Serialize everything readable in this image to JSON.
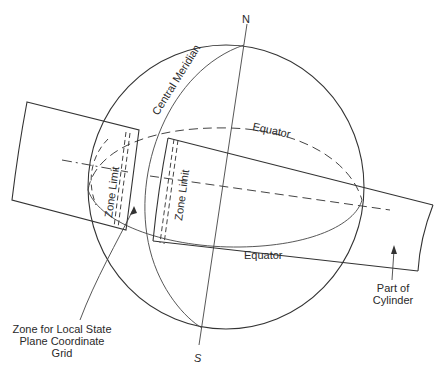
{
  "diagram": {
    "type": "transverse-mercator-projection",
    "labels": {
      "north": "N",
      "south": "S",
      "central_meridian": "Central Meridian",
      "equator_top": "Equator",
      "equator_bottom": "Equator",
      "zone_limit_left": "Zone Limit",
      "zone_limit_right": "Zone Limit",
      "zone_caption_line1": "Zone for Local State",
      "zone_caption_line2": "Plane Coordinate",
      "zone_caption_line3": "Grid",
      "cylinder_caption_line1": "Part of",
      "cylinder_caption_line2": "Cylinder"
    },
    "colors": {
      "line": "#333333",
      "background": "#ffffff"
    }
  }
}
